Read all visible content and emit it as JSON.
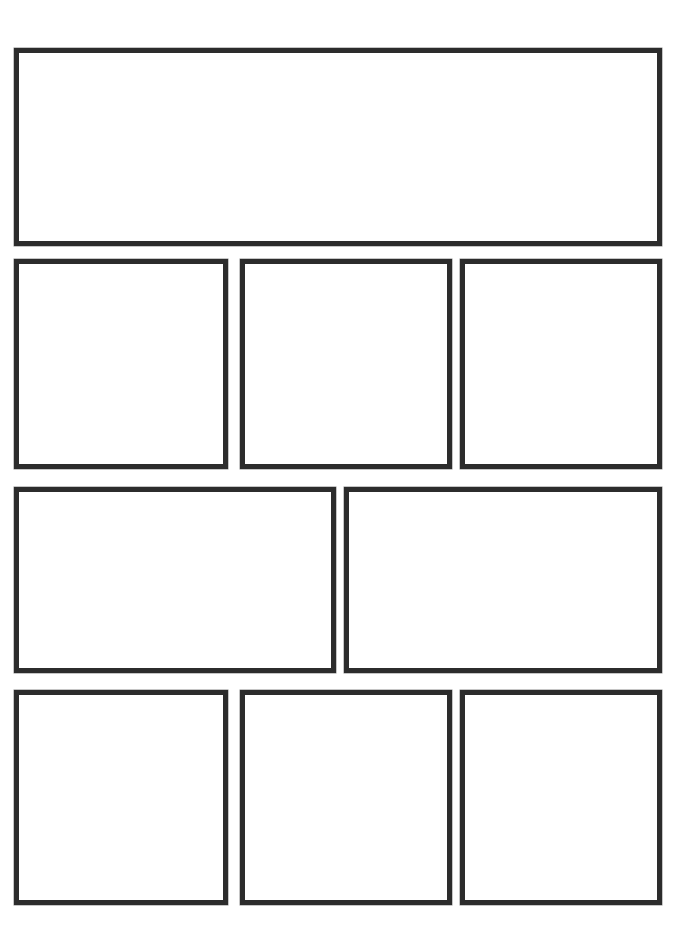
{
  "document": {
    "type": "blank-comic-page-template",
    "title": "Blank Comic Page Template",
    "description": "Empty storyboard / comic page with four rows of blank drawing panels",
    "page_width": 700,
    "page_height": 943,
    "background_color": "#ffffff",
    "panel_fill_color": "#ffffff",
    "panel_border_color": "#2c2c2c",
    "panel_border_width": 5,
    "total_panels": 9
  },
  "layout": {
    "rows": [
      {
        "name": "row-1-banner",
        "top": 48,
        "height": 198,
        "gutter": 12,
        "panels": [
          {
            "name": "panel-1",
            "label": "",
            "left": 14,
            "width": 648,
            "height": 198
          }
        ]
      },
      {
        "name": "row-2-triple",
        "top": 259,
        "height": 210,
        "gutter": 12,
        "panels": [
          {
            "name": "panel-2",
            "label": "",
            "left": 14,
            "width": 214,
            "height": 210
          },
          {
            "name": "panel-3",
            "label": "",
            "left": 240,
            "width": 212,
            "height": 210
          },
          {
            "name": "panel-4",
            "label": "",
            "left": 460,
            "width": 202,
            "height": 210
          }
        ]
      },
      {
        "name": "row-3-double",
        "top": 487,
        "height": 186,
        "gutter": 8,
        "panels": [
          {
            "name": "panel-5",
            "label": "",
            "left": 14,
            "width": 322,
            "height": 186
          },
          {
            "name": "panel-6",
            "label": "",
            "left": 344,
            "width": 318,
            "height": 186
          }
        ]
      },
      {
        "name": "row-4-triple",
        "top": 690,
        "height": 215,
        "gutter": 12,
        "panels": [
          {
            "name": "panel-7",
            "label": "",
            "left": 14,
            "width": 214,
            "height": 215
          },
          {
            "name": "panel-8",
            "label": "",
            "left": 240,
            "width": 212,
            "height": 215
          },
          {
            "name": "panel-9",
            "label": "",
            "left": 460,
            "width": 202,
            "height": 215
          }
        ]
      }
    ]
  }
}
